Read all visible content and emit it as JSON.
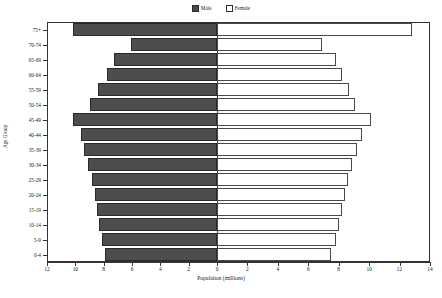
{
  "chart_data": {
    "type": "bar",
    "subtype": "population-pyramid",
    "title": "",
    "xlabel": "Population (millions)",
    "ylabel": "Age Group",
    "orientation": "horizontal",
    "grid": false,
    "legend_position": "top-center",
    "categories": [
      "0-4",
      "5-9",
      "10-14",
      "15-19",
      "20-24",
      "25-29",
      "30-34",
      "35-39",
      "40-44",
      "45-49",
      "50-54",
      "55-59",
      "60-64",
      "65-69",
      "70-74",
      "75+"
    ],
    "series": [
      {
        "name": "Male",
        "color": "#4d4d4d",
        "fill": "solid",
        "values": [
          7.9,
          8.1,
          8.3,
          8.5,
          8.6,
          8.8,
          9.1,
          9.4,
          9.6,
          10.2,
          9.0,
          8.4,
          7.8,
          7.3,
          6.1,
          10.2
        ]
      },
      {
        "name": "Female",
        "color": "#ffffff",
        "fill": "open",
        "values": [
          7.5,
          7.8,
          8.0,
          8.2,
          8.4,
          8.6,
          8.9,
          9.2,
          9.5,
          10.1,
          9.1,
          8.7,
          8.2,
          7.8,
          6.9,
          12.8
        ]
      }
    ],
    "xticks_left": [
      12,
      10,
      8,
      6,
      4,
      2,
      0
    ],
    "xticks_right": [
      0,
      2,
      4,
      6,
      8,
      10,
      12,
      14
    ],
    "xlim_left": [
      0,
      12
    ],
    "xlim_right": [
      0,
      14
    ]
  },
  "legend": {
    "entries": [
      {
        "label": "Male",
        "swatch": "filled-square-icon"
      },
      {
        "label": "Female",
        "swatch": "open-square-icon"
      }
    ]
  },
  "axes": {
    "x_title": "Population (millions)",
    "y_title": "Age Group"
  }
}
